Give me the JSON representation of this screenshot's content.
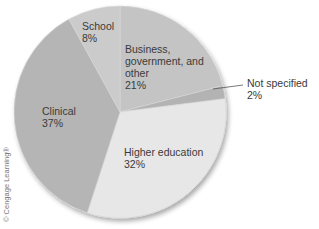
{
  "chart_data": {
    "type": "pie",
    "title": "",
    "start_angle_deg": 0,
    "direction": "clockwise",
    "slices": [
      {
        "label": "Business, government, and other",
        "value": 21,
        "display": "21%",
        "color": "#c4c4c4"
      },
      {
        "label": "Not specified",
        "value": 2,
        "display": "2%",
        "color": "#b3b3b3"
      },
      {
        "label": "Higher education",
        "value": 32,
        "display": "32%",
        "color": "#e7e7e7"
      },
      {
        "label": "Clinical",
        "value": 37,
        "display": "37%",
        "color": "#b5b5b5"
      },
      {
        "label": "School",
        "value": 8,
        "display": "8%",
        "color": "#cbcbcb"
      }
    ],
    "legend": "none (direct labels)",
    "units": "percent"
  },
  "labels": {
    "school": "School\n8%",
    "business": "Business,\ngovernment, and\nother\n21%",
    "not_specified": "Not specified\n2%",
    "clinical": "Clinical\n37%",
    "higher_education": "Higher education\n32%"
  },
  "credit": "© Cengage Learning®"
}
